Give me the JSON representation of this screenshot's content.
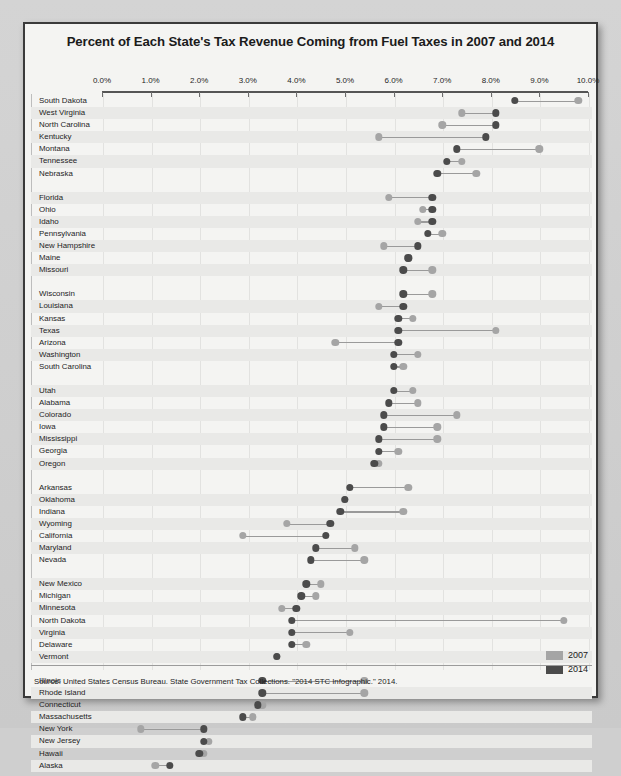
{
  "title": "Percent of Each State's Tax Revenue Coming from Fuel Taxes in 2007 and 2014",
  "source": "Source: United States Census Bureau. State Government Tax Collections. \"2014 STC Infographic.\" 2014.",
  "legend": {
    "items": [
      {
        "label": "2007",
        "color": "#a5a5a5"
      },
      {
        "label": "2014",
        "color": "#4b4b4b"
      }
    ]
  },
  "chart_data": {
    "type": "scatter",
    "subtype": "dumbbell",
    "title": "Percent of Each State's Tax Revenue Coming from Fuel Taxes in 2007 and 2014",
    "xlabel": "",
    "ylabel": "",
    "xlim": [
      0,
      10
    ],
    "xunit": "%",
    "grid": true,
    "legend_position": "bottom-right",
    "tick_labels": [
      "0.0%",
      "1.0%",
      "2.0%",
      "3.0%",
      "4.0%",
      "5.0%",
      "6.0%",
      "7.0%",
      "8.0%",
      "9.0%",
      "10.0%"
    ],
    "tick_values": [
      0,
      1,
      2,
      3,
      4,
      5,
      6,
      7,
      8,
      9,
      10
    ],
    "series": [
      {
        "name": "2007",
        "color": "#a5a5a5"
      },
      {
        "name": "2014",
        "color": "#4b4b4b"
      }
    ],
    "groups": [
      {
        "rows": [
          {
            "state": "South Dakota",
            "v2007": 9.8,
            "v2014": 8.5
          },
          {
            "state": "West Virginia",
            "v2007": 7.4,
            "v2014": 8.1
          },
          {
            "state": "North Carolina",
            "v2007": 7.0,
            "v2014": 8.1
          },
          {
            "state": "Kentucky",
            "v2007": 5.7,
            "v2014": 7.9
          },
          {
            "state": "Montana",
            "v2007": 9.0,
            "v2014": 7.3
          },
          {
            "state": "Tennessee",
            "v2007": 7.4,
            "v2014": 7.1
          },
          {
            "state": "Nebraska",
            "v2007": 7.7,
            "v2014": 6.9
          }
        ]
      },
      {
        "rows": [
          {
            "state": "Florida",
            "v2007": 5.9,
            "v2014": 6.8
          },
          {
            "state": "Ohio",
            "v2007": 6.6,
            "v2014": 6.8
          },
          {
            "state": "Idaho",
            "v2007": 6.5,
            "v2014": 6.8
          },
          {
            "state": "Pennsylvania",
            "v2007": 7.0,
            "v2014": 6.7
          },
          {
            "state": "New Hampshire",
            "v2007": 5.8,
            "v2014": 6.5
          },
          {
            "state": "Maine",
            "v2007": 6.3,
            "v2014": 6.3
          },
          {
            "state": "Missouri",
            "v2007": 6.8,
            "v2014": 6.2
          }
        ]
      },
      {
        "rows": [
          {
            "state": "Wisconsin",
            "v2007": 6.8,
            "v2014": 6.2
          },
          {
            "state": "Louisiana",
            "v2007": 5.7,
            "v2014": 6.2
          },
          {
            "state": "Kansas",
            "v2007": 6.4,
            "v2014": 6.1
          },
          {
            "state": "Texas",
            "v2007": 8.1,
            "v2014": 6.1
          },
          {
            "state": "Arizona",
            "v2007": 4.8,
            "v2014": 6.1
          },
          {
            "state": "Washington",
            "v2007": 6.5,
            "v2014": 6.0
          },
          {
            "state": "South Carolina",
            "v2007": 6.2,
            "v2014": 6.0
          }
        ]
      },
      {
        "rows": [
          {
            "state": "Utah",
            "v2007": 6.4,
            "v2014": 6.0
          },
          {
            "state": "Alabama",
            "v2007": 6.5,
            "v2014": 5.9
          },
          {
            "state": "Colorado",
            "v2007": 7.3,
            "v2014": 5.8
          },
          {
            "state": "Iowa",
            "v2007": 6.9,
            "v2014": 5.8
          },
          {
            "state": "Mississippi",
            "v2007": 6.9,
            "v2014": 5.7
          },
          {
            "state": "Georgia",
            "v2007": 6.1,
            "v2014": 5.7
          },
          {
            "state": "Oregon",
            "v2007": 5.7,
            "v2014": 5.6
          }
        ]
      },
      {
        "rows": [
          {
            "state": "Arkansas",
            "v2007": 6.3,
            "v2014": 5.1
          },
          {
            "state": "Oklahoma",
            "v2007": 5.0,
            "v2014": 5.0
          },
          {
            "state": "Indiana",
            "v2007": 6.2,
            "v2014": 4.9
          },
          {
            "state": "Wyoming",
            "v2007": 3.8,
            "v2014": 4.7
          },
          {
            "state": "California",
            "v2007": 2.9,
            "v2014": 4.6
          },
          {
            "state": "Maryland",
            "v2007": 5.2,
            "v2014": 4.4
          },
          {
            "state": "Nevada",
            "v2007": 5.4,
            "v2014": 4.3
          }
        ]
      },
      {
        "rows": [
          {
            "state": "New Mexico",
            "v2007": 4.5,
            "v2014": 4.2
          },
          {
            "state": "Michigan",
            "v2007": 4.4,
            "v2014": 4.1
          },
          {
            "state": "Minnesota",
            "v2007": 3.7,
            "v2014": 4.0
          },
          {
            "state": "North Dakota",
            "v2007": 9.5,
            "v2014": 3.9
          },
          {
            "state": "Virginia",
            "v2007": 5.1,
            "v2014": 3.9
          },
          {
            "state": "Delaware",
            "v2007": 4.2,
            "v2014": 3.9
          },
          {
            "state": "Vermont",
            "v2007": 3.6,
            "v2014": 3.6
          }
        ]
      },
      {
        "rows": [
          {
            "state": "Illinois",
            "v2007": 5.4,
            "v2014": 3.3
          },
          {
            "state": "Rhode Island",
            "v2007": 5.4,
            "v2014": 3.3
          },
          {
            "state": "Connecticut",
            "v2007": 3.3,
            "v2014": 3.2
          },
          {
            "state": "Massachusetts",
            "v2007": 3.1,
            "v2014": 2.9
          },
          {
            "state": "New York",
            "v2007": 0.8,
            "v2014": 2.1
          },
          {
            "state": "New Jersey",
            "v2007": 2.2,
            "v2014": 2.1
          },
          {
            "state": "Hawaii",
            "v2007": 2.1,
            "v2014": 2.0
          },
          {
            "state": "Alaska",
            "v2007": 1.1,
            "v2014": 1.4
          }
        ]
      }
    ]
  }
}
